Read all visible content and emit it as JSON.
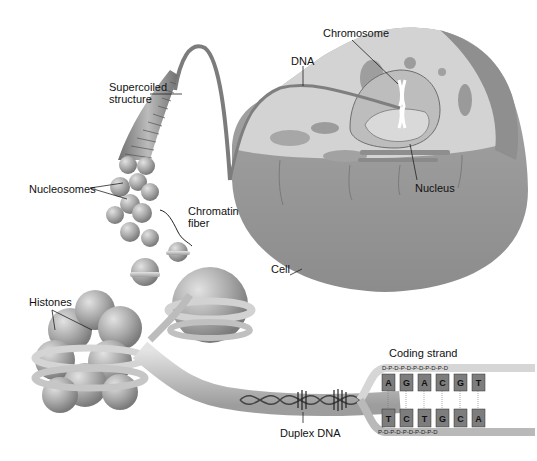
{
  "labels": {
    "chromosome": "Chromosome",
    "dna": "DNA",
    "supercoiled_line1": "Supercoiled",
    "supercoiled_line2": "structure",
    "nucleosomes": "Nucleosomes",
    "chromatin_line1": "Chromatin",
    "chromatin_line2": "fiber",
    "nucleus": "Nucleus",
    "cell": "Cell",
    "histones": "Histones",
    "coding_strand": "Coding strand",
    "duplex_dna": "Duplex DNA"
  },
  "dna_sequence": {
    "coding_strand_bases": [
      "A",
      "G",
      "A",
      "C",
      "G",
      "T"
    ],
    "template_strand_bases": [
      "T",
      "C",
      "T",
      "G",
      "C",
      "A"
    ],
    "top_backbone": "D-P-D-P-D-P-D-P-D-P-D",
    "bottom_backbone": "P-D-P-D-P-D-P-D-P-D"
  },
  "colors": {
    "cell_body": "#9a9a9a",
    "cell_top": "#cfcfcf",
    "histone": "#a8a8a8",
    "dna_band": "#c9c9c9",
    "base_box": "#7d7d7d",
    "label_text": "#111111"
  }
}
